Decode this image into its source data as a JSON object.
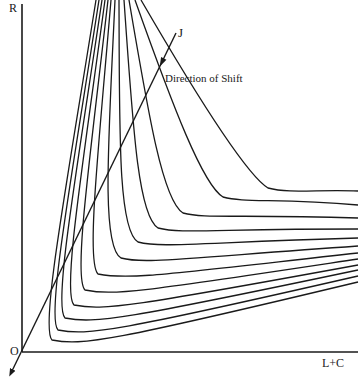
{
  "figure": {
    "labels": {
      "y_axis": "R",
      "origin": "O",
      "x_axis": "L+C",
      "ray": "J",
      "annotation": "Direction of Shift"
    },
    "colors": {
      "line": "#1a1a1a",
      "background": "#ffffff"
    },
    "origin": [
      22,
      352
    ],
    "ray": {
      "from": [
        11,
        373
      ],
      "to": [
        176,
        33
      ],
      "arrowhead_at": [
        162,
        62
      ]
    },
    "curves": [
      {
        "top_x": 96,
        "min": [
          42,
          340
        ],
        "right_y": 282
      },
      {
        "top_x": 99,
        "min": [
          48,
          330
        ],
        "right_y": 276
      },
      {
        "top_x": 102,
        "min": [
          55,
          318
        ],
        "right_y": 270
      },
      {
        "top_x": 105,
        "min": [
          64,
          305
        ],
        "right_y": 265
      },
      {
        "top_x": 108,
        "min": [
          75,
          290
        ],
        "right_y": 259
      },
      {
        "top_x": 111,
        "min": [
          88,
          274
        ],
        "right_y": 253
      },
      {
        "top_x": 115,
        "min": [
          103,
          258
        ],
        "right_y": 246
      },
      {
        "top_x": 119,
        "min": [
          120,
          242
        ],
        "right_y": 238
      },
      {
        "top_x": 124,
        "min": [
          140,
          228
        ],
        "right_y": 229
      },
      {
        "top_x": 129,
        "min": [
          165,
          213
        ],
        "right_y": 218
      },
      {
        "top_x": 135,
        "min": [
          205,
          197
        ],
        "right_y": 205
      },
      {
        "top_x": 141,
        "min": [
          250,
          188
        ],
        "right_y": 191
      }
    ]
  }
}
